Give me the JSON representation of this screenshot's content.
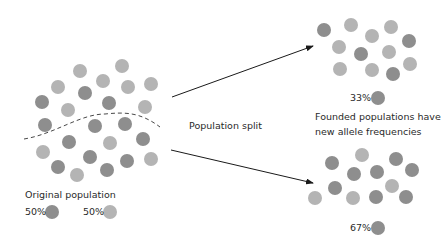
{
  "colors": {
    "allele_dark": "#8e8e8e",
    "allele_light": "#b4b4b4",
    "arrow": "#1a1a1a",
    "divider": "#333333",
    "text": "#2a2a2a"
  },
  "labels": {
    "original_population": "Original population",
    "population_split": "Population split",
    "founded_line1": "Founded populations have",
    "founded_line2": "new allele frequencies",
    "orig_dark_pct": "50%",
    "orig_light_pct": "50%",
    "top_pct": "33%",
    "bottom_pct": "67%"
  },
  "original_population": {
    "dots": [
      {
        "x": 80,
        "y": 71,
        "t": "light"
      },
      {
        "x": 122,
        "y": 66,
        "t": "light"
      },
      {
        "x": 58,
        "y": 87,
        "t": "light"
      },
      {
        "x": 103,
        "y": 81,
        "t": "light"
      },
      {
        "x": 128,
        "y": 87,
        "t": "light"
      },
      {
        "x": 151,
        "y": 84,
        "t": "light"
      },
      {
        "x": 85,
        "y": 93,
        "t": "dark"
      },
      {
        "x": 42,
        "y": 102,
        "t": "dark"
      },
      {
        "x": 68,
        "y": 110,
        "t": "light"
      },
      {
        "x": 109,
        "y": 103,
        "t": "dark"
      },
      {
        "x": 145,
        "y": 107,
        "t": "light"
      },
      {
        "x": 45,
        "y": 125,
        "t": "dark"
      },
      {
        "x": 95,
        "y": 126,
        "t": "dark"
      },
      {
        "x": 125,
        "y": 124,
        "t": "dark"
      },
      {
        "x": 69,
        "y": 142,
        "t": "dark"
      },
      {
        "x": 110,
        "y": 143,
        "t": "light"
      },
      {
        "x": 143,
        "y": 139,
        "t": "dark"
      },
      {
        "x": 43,
        "y": 152,
        "t": "light"
      },
      {
        "x": 90,
        "y": 157,
        "t": "dark"
      },
      {
        "x": 127,
        "y": 161,
        "t": "dark"
      },
      {
        "x": 151,
        "y": 159,
        "t": "light"
      },
      {
        "x": 58,
        "y": 167,
        "t": "dark"
      },
      {
        "x": 77,
        "y": 175,
        "t": "light"
      },
      {
        "x": 107,
        "y": 170,
        "t": "dark"
      }
    ]
  },
  "top_population": {
    "dots": [
      {
        "x": 324,
        "y": 30,
        "t": "dark"
      },
      {
        "x": 351,
        "y": 25,
        "t": "light"
      },
      {
        "x": 372,
        "y": 36,
        "t": "light"
      },
      {
        "x": 391,
        "y": 27,
        "t": "light"
      },
      {
        "x": 409,
        "y": 41,
        "t": "dark"
      },
      {
        "x": 339,
        "y": 47,
        "t": "light"
      },
      {
        "x": 361,
        "y": 54,
        "t": "dark"
      },
      {
        "x": 389,
        "y": 52,
        "t": "light"
      },
      {
        "x": 340,
        "y": 69,
        "t": "light"
      },
      {
        "x": 372,
        "y": 70,
        "t": "light"
      },
      {
        "x": 393,
        "y": 74,
        "t": "dark"
      },
      {
        "x": 410,
        "y": 64,
        "t": "light"
      }
    ]
  },
  "bottom_population": {
    "dots": [
      {
        "x": 362,
        "y": 155,
        "t": "light"
      },
      {
        "x": 396,
        "y": 159,
        "t": "dark"
      },
      {
        "x": 332,
        "y": 163,
        "t": "dark"
      },
      {
        "x": 354,
        "y": 174,
        "t": "dark"
      },
      {
        "x": 377,
        "y": 172,
        "t": "dark"
      },
      {
        "x": 412,
        "y": 170,
        "t": "dark"
      },
      {
        "x": 392,
        "y": 186,
        "t": "light"
      },
      {
        "x": 335,
        "y": 188,
        "t": "dark"
      },
      {
        "x": 315,
        "y": 198,
        "t": "light"
      },
      {
        "x": 353,
        "y": 198,
        "t": "light"
      },
      {
        "x": 376,
        "y": 197,
        "t": "dark"
      },
      {
        "x": 406,
        "y": 197,
        "t": "dark"
      }
    ]
  },
  "legend_dots": [
    {
      "x": 52,
      "y": 212,
      "t": "dark"
    },
    {
      "x": 110,
      "y": 212,
      "t": "light"
    },
    {
      "x": 378,
      "y": 98,
      "t": "dark"
    },
    {
      "x": 378,
      "y": 228,
      "t": "dark"
    }
  ],
  "arrows": [
    {
      "x1": 172,
      "y1": 97,
      "x2": 313,
      "y2": 46
    },
    {
      "x1": 171,
      "y1": 150,
      "x2": 313,
      "y2": 183
    }
  ],
  "divider_path": "M24,139 C55,134 80,114 105,114 C125,112 140,112 160,127"
}
